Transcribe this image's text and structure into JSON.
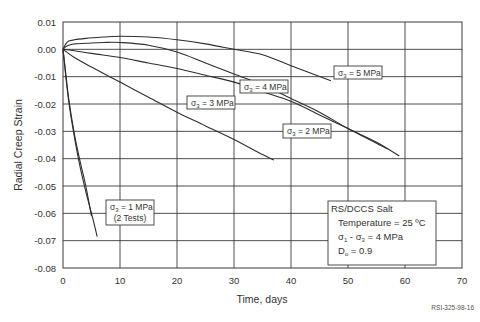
{
  "chart_data": {
    "type": "line",
    "title": "",
    "xlabel": "Time, days",
    "ylabel": "Radial Creep Strain",
    "xlim": [
      0,
      70
    ],
    "ylim": [
      -0.08,
      0.01
    ],
    "x_ticks": [
      "0",
      "10",
      "20",
      "30",
      "40",
      "50",
      "60",
      "70"
    ],
    "y_ticks": [
      "0.01",
      "0.00",
      "-0.01",
      "-0.02",
      "-0.03",
      "-0.04",
      "-0.05",
      "-0.06",
      "-0.07",
      "-0.08"
    ],
    "grid": true,
    "legend_position": "inline labels",
    "series": [
      {
        "name": "σ3 = 5 MPa",
        "x": [
          0,
          0.5,
          1,
          2,
          4,
          7,
          10,
          15,
          20,
          25,
          30,
          35,
          40,
          47
        ],
        "y": [
          0.0,
          0.002,
          0.003,
          0.0035,
          0.004,
          0.0045,
          0.0048,
          0.0045,
          0.0035,
          0.002,
          0.0,
          -0.002,
          -0.006,
          -0.0115
        ]
      },
      {
        "name": "σ3 = 4 MPa",
        "x": [
          0,
          0.5,
          1,
          2,
          4,
          7,
          10,
          15,
          20,
          25,
          30,
          35,
          40,
          45,
          50,
          57
        ],
        "y": [
          0.0,
          0.001,
          0.0015,
          0.002,
          0.0022,
          0.0025,
          0.0025,
          0.0015,
          -0.001,
          -0.005,
          -0.009,
          -0.013,
          -0.018,
          -0.023,
          -0.029,
          -0.0365
        ]
      },
      {
        "name": "σ3 = 3 MPa",
        "x": [
          0,
          2,
          5,
          10,
          15,
          20,
          25,
          30,
          35,
          40,
          45,
          50,
          55,
          59
        ],
        "y": [
          0.0,
          -0.0005,
          -0.0015,
          -0.003,
          -0.005,
          -0.007,
          -0.0095,
          -0.012,
          -0.0155,
          -0.019,
          -0.024,
          -0.029,
          -0.034,
          -0.039
        ]
      },
      {
        "name": "σ3 = 2 MPa",
        "x": [
          0,
          2,
          5,
          10,
          15,
          20,
          25,
          30,
          35,
          37
        ],
        "y": [
          0.0,
          -0.003,
          -0.0065,
          -0.012,
          -0.0175,
          -0.023,
          -0.028,
          -0.033,
          -0.0385,
          -0.0405
        ]
      },
      {
        "name": "σ3 = 1 MPa (test 1)",
        "x": [
          0,
          0.5,
          1,
          2,
          3,
          4,
          5
        ],
        "y": [
          0.0,
          -0.009,
          -0.018,
          -0.031,
          -0.041,
          -0.05,
          -0.061
        ]
      },
      {
        "name": "σ3 = 1 MPa (test 2)",
        "x": [
          0,
          0.5,
          1,
          2,
          3,
          4,
          5,
          6
        ],
        "y": [
          0.0,
          -0.01,
          -0.019,
          -0.032,
          -0.043,
          -0.052,
          -0.06,
          -0.0685
        ]
      }
    ],
    "annotations": [
      {
        "text": "σ3 = 5 MPa",
        "x": 46,
        "y": -0.0095
      },
      {
        "text": "σ3 = 4 MPa",
        "x": 32,
        "y": -0.0145
      },
      {
        "text": "σ3 = 3 MPa",
        "x": 22,
        "y": -0.019
      },
      {
        "text": "σ3 = 2 MPa",
        "x": 38,
        "y": -0.0405
      },
      {
        "text": "σ3 = 1 MPa (2 Tests)",
        "x": 8,
        "y": -0.062
      },
      {
        "text": "RS/DCCS Salt; Temperature = 25 ºC; σ1 - σ3 = 4 MPa; Do = 0.9",
        "x": 45,
        "y": -0.065
      }
    ]
  },
  "axes": {
    "x_label": "Time, days",
    "y_label": "Radial Creep Strain",
    "x_ticks": [
      "0",
      "10",
      "20",
      "30",
      "40",
      "50",
      "60",
      "70"
    ],
    "y_ticks": [
      "0.01",
      "0.00",
      "-0.01",
      "-0.02",
      "-0.03",
      "-0.04",
      "-0.05",
      "-0.06",
      "-0.07",
      "-0.08"
    ]
  },
  "labels": {
    "s5": {
      "sigma": "σ",
      "sub": "3",
      "rest": " = 5 MPa"
    },
    "s4": {
      "sigma": "σ",
      "sub": "3",
      "rest": " = 4 MPa"
    },
    "s3": {
      "sigma": "σ",
      "sub": "3",
      "rest": " = 3 MPa"
    },
    "s2": {
      "sigma": "σ",
      "sub": "3",
      "rest": " = 2 MPa"
    },
    "s1": {
      "sigma": "σ",
      "sub": "3",
      "rest": " = 1 MPa",
      "line2": "(2 Tests)"
    }
  },
  "info_box": {
    "title": "RS/DCCS Salt",
    "temperature": "Temperature = 25 ºC",
    "stress_a": "σ",
    "stress_a_sub": "1",
    "stress_mid": " - σ",
    "stress_b_sub": "3",
    "stress_rest": " = 4 MPa",
    "damage": "D",
    "damage_sub": "o",
    "damage_rest": " = 0.9"
  },
  "figure_id": "RSI-325-98-16"
}
